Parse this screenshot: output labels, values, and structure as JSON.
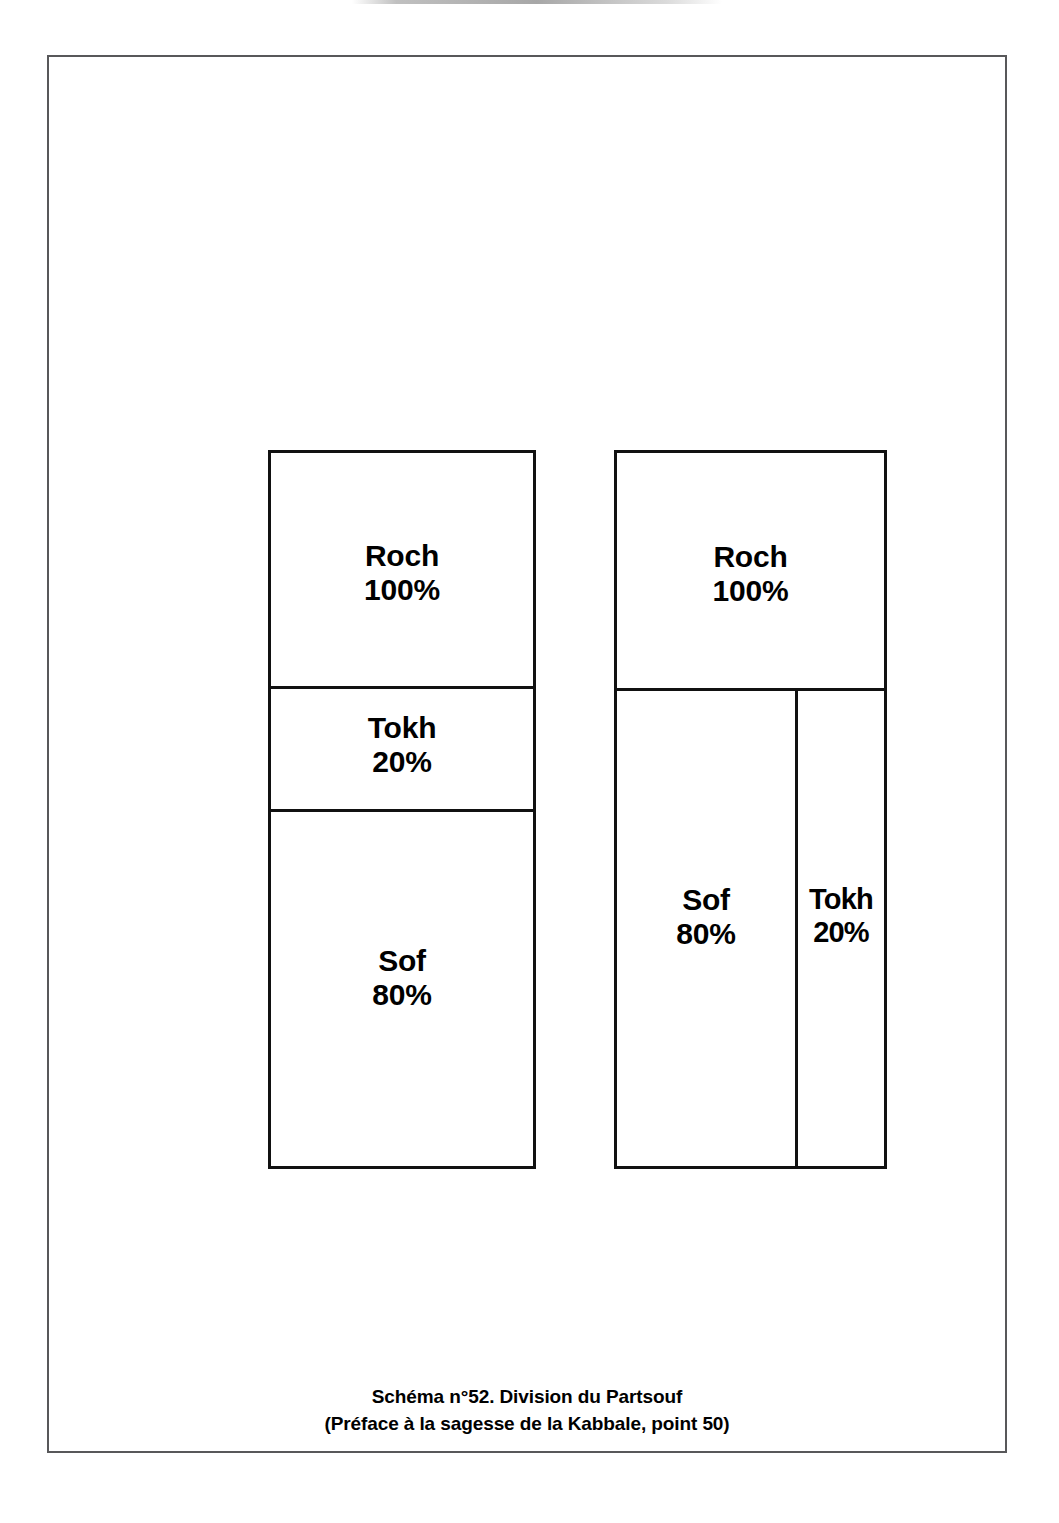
{
  "document": {
    "type": "kabbalah-schematic-figure",
    "page_background": "#ffffff",
    "border_color": "#58585a",
    "line_color": "#111111"
  },
  "caption": {
    "line1": "Schéma n°52. Division du Partsouf",
    "line2": "(Préface à la sagesse de la Kabbale, point 50)"
  },
  "diagrams": [
    {
      "id": "left",
      "arrangement": "vertical-stack",
      "segments": [
        {
          "name": "Roch",
          "percent": "100%"
        },
        {
          "name": "Tokh",
          "percent": "20%"
        },
        {
          "name": "Sof",
          "percent": "80%"
        }
      ]
    },
    {
      "id": "right",
      "arrangement": "roch-over-split",
      "segments": [
        {
          "name": "Roch",
          "percent": "100%"
        },
        {
          "name": "Sof",
          "percent": "80%"
        },
        {
          "name": "Tokh",
          "percent": "20%"
        }
      ]
    }
  ],
  "chart_data": {
    "type": "table",
    "title": "Schéma n°52. Division du Partsouf",
    "subtitle": "(Préface à la sagesse de la Kabbale, point 50)",
    "categories": [
      "Roch",
      "Tokh",
      "Sof"
    ],
    "values": [
      100,
      20,
      80
    ],
    "unit": "%",
    "series": [
      {
        "name": "Partsouf (division verticale)",
        "categories": [
          "Roch",
          "Tokh",
          "Sof"
        ],
        "values": [
          100,
          20,
          80
        ]
      },
      {
        "name": "Partsouf (Sof et Tokh côte à côte)",
        "categories": [
          "Roch",
          "Sof",
          "Tokh"
        ],
        "values": [
          100,
          80,
          20
        ]
      }
    ],
    "xlabel": "",
    "ylabel": "",
    "grid": false,
    "legend": "none"
  }
}
